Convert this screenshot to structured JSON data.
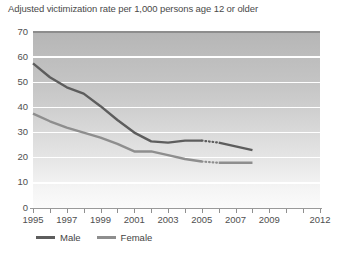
{
  "chart_title": "Adjusted victimization rate per 1,000 persons age 12 or older",
  "legend": {
    "items": [
      {
        "label": "Male",
        "color": "#5d5d5d"
      },
      {
        "label": "Female",
        "color": "#8e8e8e"
      }
    ]
  },
  "axes": {
    "y_ticks": [
      "0",
      "10",
      "20",
      "30",
      "40",
      "50",
      "60",
      "70"
    ],
    "x_labels": [
      "1995",
      "1997",
      "1999",
      "2001",
      "2003",
      "2005",
      "2007",
      "2009",
      "2012"
    ],
    "x_tick_years": [
      1995,
      1996,
      1997,
      1998,
      1999,
      2000,
      2001,
      2002,
      2003,
      2004,
      2005,
      2006,
      2007,
      2008,
      2009,
      2010,
      2011,
      2012
    ]
  },
  "colors": {
    "male_line": "#5d5d5d",
    "female_line": "#8e8e8e",
    "gridline": "#ffffff",
    "plot_top": "#b6b6b6",
    "plot_bottom": "#fbfbfb",
    "axis": "#8f8f8f",
    "text": "#4f4f4f"
  },
  "chart_data": {
    "type": "line",
    "title": "Adjusted victimization rate per 1,000 persons age 12 or older",
    "xlabel": "",
    "ylabel": "",
    "xlim": [
      1995,
      2012
    ],
    "ylim": [
      0,
      70
    ],
    "y_ticks": [
      0,
      10,
      20,
      30,
      40,
      50,
      60,
      70
    ],
    "x_tick_labels": [
      "1995",
      "1997",
      "1999",
      "2001",
      "2003",
      "2005",
      "2007",
      "2009",
      "2012"
    ],
    "grid": "horizontal",
    "legend_position": "below-axis-left",
    "x": [
      1995,
      1996,
      1997,
      1998,
      1999,
      2000,
      2001,
      2002,
      2003,
      2004,
      2005,
      2006,
      2007,
      2008
    ],
    "series": [
      {
        "name": "Male",
        "color": "#5d5d5d",
        "values": [
          57.5,
          52.0,
          48.0,
          45.5,
          40.5,
          35.0,
          30.0,
          26.5,
          26.0,
          26.8,
          26.8,
          26.0,
          24.5,
          23.0
        ],
        "dotted_segment": {
          "from_x": 2005,
          "to_x": 2006,
          "note": "break in series shown as dotted line"
        }
      },
      {
        "name": "Female",
        "color": "#8e8e8e",
        "values": [
          37.5,
          34.5,
          32.0,
          30.0,
          28.0,
          25.5,
          22.5,
          22.5,
          21.0,
          19.5,
          18.5,
          18.0,
          18.0,
          18.0
        ],
        "dotted_segment": {
          "from_x": 2005,
          "to_x": 2006,
          "note": "break in series shown as dotted line"
        }
      }
    ]
  }
}
